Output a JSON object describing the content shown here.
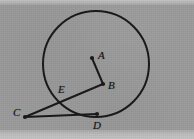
{
  "figure": {
    "background_color": "#9a9a9a",
    "ink_color": "#1a1a1a",
    "width": 194,
    "height": 139
  },
  "labels": {
    "a": "A",
    "b": "B",
    "c": "C",
    "d": "D",
    "e": "E"
  },
  "chart_data": {
    "type": "diagram",
    "xlabel": "",
    "ylabel": "",
    "xlim": [
      0,
      194
    ],
    "ylim": [
      0,
      139
    ],
    "grid": false,
    "legend": "none",
    "shapes": [
      {
        "kind": "circle",
        "name": "main-circle",
        "cx": 96,
        "cy": 64,
        "r": 53,
        "stroke": "#1a1a1a",
        "stroke_width": 2,
        "fill": "none"
      },
      {
        "kind": "segment",
        "name": "segment-AB",
        "from": "A",
        "to": "B",
        "x1": 92,
        "y1": 58,
        "x2": 103,
        "y2": 84,
        "stroke": "#1a1a1a",
        "stroke_width": 2
      },
      {
        "kind": "segment",
        "name": "secant-CB",
        "from": "C",
        "to": "B",
        "x1": 25,
        "y1": 117,
        "x2": 103,
        "y2": 84,
        "stroke": "#1a1a1a",
        "stroke_width": 2,
        "note": "secant through E"
      },
      {
        "kind": "segment",
        "name": "tangent-CD",
        "from": "C",
        "to": "D",
        "x1": 25,
        "y1": 117,
        "x2": 97,
        "y2": 114,
        "stroke": "#1a1a1a",
        "stroke_width": 2,
        "note": "tangent at D"
      }
    ],
    "points": [
      {
        "name": "A",
        "x": 92,
        "y": 58,
        "label": "A",
        "label_x": 98,
        "label_y": 50,
        "on_circle": false,
        "marker": "dot"
      },
      {
        "name": "B",
        "x": 103,
        "y": 84,
        "label": "B",
        "label_x": 108,
        "label_y": 80,
        "on_circle": false,
        "marker": "dot"
      },
      {
        "name": "C",
        "x": 25,
        "y": 117,
        "label": "C",
        "label_x": 13,
        "label_y": 107,
        "on_circle": false,
        "marker": "dot"
      },
      {
        "name": "D",
        "x": 97,
        "y": 114,
        "label": "D",
        "label_x": 93,
        "label_y": 120,
        "on_circle": true,
        "marker": "dot"
      },
      {
        "name": "E",
        "x": 58,
        "y": 96,
        "label": "E",
        "label_x": 58,
        "label_y": 84,
        "on_circle": true,
        "marker": "none"
      }
    ]
  }
}
